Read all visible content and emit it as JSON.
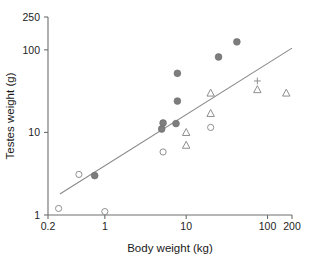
{
  "chart_data": {
    "type": "scatter",
    "title": "",
    "xlabel": "Body weight (kg)",
    "ylabel": "Testes weight (g)",
    "xscale": "log",
    "yscale": "log",
    "xlim": [
      0.2,
      200
    ],
    "ylim": [
      1,
      250
    ],
    "xticks": [
      0.2,
      1,
      10,
      100,
      200
    ],
    "xtick_labels": [
      "0.2",
      "1",
      "10",
      "100",
      "200"
    ],
    "yticks": [
      1,
      10,
      100,
      250
    ],
    "ytick_labels": [
      "1",
      "10",
      "100",
      "250"
    ],
    "grid": false,
    "legend": "none",
    "series": [
      {
        "name": "filled-circle",
        "marker": "filled circle",
        "color": "#7d7d7d",
        "points": [
          {
            "x": 0.75,
            "y": 3.0
          },
          {
            "x": 5.0,
            "y": 11.0
          },
          {
            "x": 5.2,
            "y": 13.0
          },
          {
            "x": 7.5,
            "y": 12.8
          },
          {
            "x": 7.8,
            "y": 24.0
          },
          {
            "x": 7.8,
            "y": 52.0
          },
          {
            "x": 25.0,
            "y": 82.0
          },
          {
            "x": 42.0,
            "y": 125.0
          }
        ]
      },
      {
        "name": "open-circle",
        "marker": "open circle",
        "color": "#8f8f8f",
        "points": [
          {
            "x": 0.27,
            "y": 1.2
          },
          {
            "x": 0.48,
            "y": 3.1
          },
          {
            "x": 1.0,
            "y": 1.1
          },
          {
            "x": 5.2,
            "y": 5.8
          },
          {
            "x": 20.0,
            "y": 11.5
          }
        ]
      },
      {
        "name": "open-triangle",
        "marker": "open triangle",
        "color": "#8f8f8f",
        "points": [
          {
            "x": 10.0,
            "y": 7.0
          },
          {
            "x": 10.0,
            "y": 10.0
          },
          {
            "x": 20.0,
            "y": 17.0
          },
          {
            "x": 20.0,
            "y": 30.0
          },
          {
            "x": 75.0,
            "y": 33.0
          },
          {
            "x": 170.0,
            "y": 30.0
          }
        ]
      },
      {
        "name": "plus",
        "marker": "plus",
        "color": "#8f8f8f",
        "points": [
          {
            "x": 75.0,
            "y": 42.0
          }
        ]
      }
    ],
    "fit_line": {
      "name": "regression-line",
      "color": "#8a8a8a",
      "x_start": 0.28,
      "y_start": 1.8,
      "x_end": 200.0,
      "y_end": 105.0
    }
  }
}
